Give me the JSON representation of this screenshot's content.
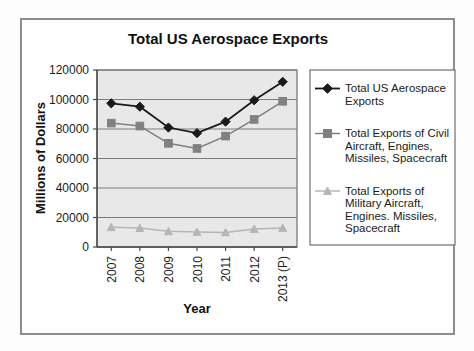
{
  "figure": {
    "title": "Total US Aerospace Exports",
    "frame_color": "#8d8d8d",
    "plot_background": "#e8e8e8",
    "gridline_color": "#7d7d7d"
  },
  "chart_data": {
    "type": "line",
    "title": "Total US Aerospace Exports",
    "xlabel": "Year",
    "ylabel": "Millions of Dollars",
    "categories": [
      "2007",
      "2008",
      "2009",
      "2010",
      "2011",
      "2012",
      "2013 (P)"
    ],
    "ylim": [
      0,
      120000
    ],
    "ytick_values": [
      0,
      20000,
      40000,
      60000,
      80000,
      100000,
      120000
    ],
    "ytick_labels": [
      "0",
      "20000",
      "40000",
      "60000",
      "80000",
      "100000",
      "120000"
    ],
    "grid": "horizontal",
    "legend_position": "right",
    "series": [
      {
        "name": "Total US Aerospace Exports",
        "color": "#1a1a1a",
        "marker": "diamond",
        "values": [
          97400,
          95100,
          81000,
          77200,
          85000,
          99500,
          112000
        ]
      },
      {
        "name": "Total Exports of Civil Aircraft, Engines, Missiles, Spacecraft",
        "color": "#808080",
        "marker": "square",
        "values": [
          84000,
          82000,
          70300,
          66800,
          75200,
          86500,
          98800
        ]
      },
      {
        "name": "Total Exports of Military Aircraft, Engines. Missiles, Spacecraft",
        "color": "#b5b5b5",
        "marker": "triangle",
        "values": [
          13400,
          12800,
          10600,
          10200,
          9900,
          12200,
          12900
        ]
      }
    ]
  },
  "legend": {
    "entries": [
      {
        "lines": [
          "Total US Aerospace",
          "Exports"
        ],
        "marker": "diamond",
        "color": "#1a1a1a"
      },
      {
        "lines": [
          "Total Exports of Civil",
          "Aircraft, Engines,",
          "Missiles, Spacecraft"
        ],
        "marker": "square",
        "color": "#808080"
      },
      {
        "lines": [
          "Total Exports of",
          "Military Aircraft,",
          "Engines. Missiles,",
          "Spacecraft"
        ],
        "marker": "triangle",
        "color": "#b5b5b5"
      }
    ]
  }
}
